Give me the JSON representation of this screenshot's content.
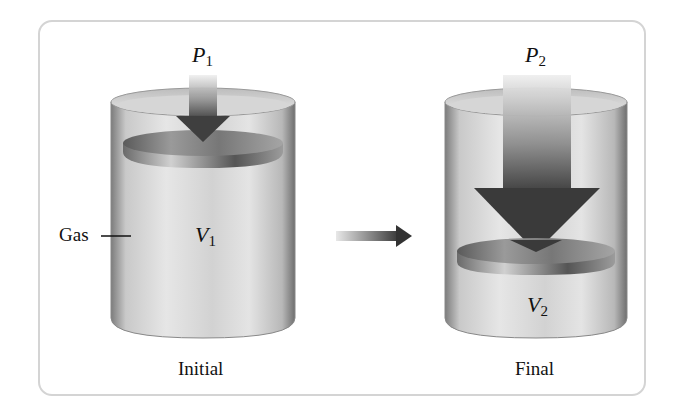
{
  "diagram": {
    "initial": {
      "caption": "Initial",
      "pressure_symbol": "P",
      "pressure_sub": "1",
      "volume_symbol": "V",
      "volume_sub": "1",
      "side_label": "Gas"
    },
    "final": {
      "caption": "Final",
      "pressure_symbol": "P",
      "pressure_sub": "2",
      "volume_symbol": "V",
      "volume_sub": "2"
    },
    "transition_arrow": "right-arrow",
    "colors": {
      "frame": "#d4d4d4",
      "cylinder": "#c8c8c8",
      "piston": "#8a8a8a",
      "arrow_dark": "#3a3a3a",
      "text": "#111111"
    }
  }
}
